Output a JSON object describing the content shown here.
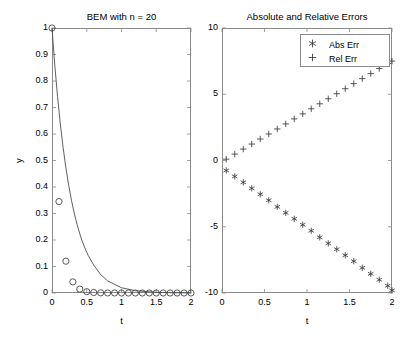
{
  "figure": {
    "width": 402,
    "height": 338,
    "background": "#ffffff",
    "axis_color": "#8a8a8a",
    "data_color": "#4d4d4d",
    "marker_color": "#3c3c3c"
  },
  "chart_data": [
    {
      "id": "left",
      "type": "line",
      "title": "BEM with n = 20",
      "xlabel": "t",
      "ylabel": "y",
      "xlim": [
        0,
        2
      ],
      "ylim": [
        0,
        1
      ],
      "grid": false,
      "legend": null,
      "xticks": [
        0,
        0.5,
        1,
        1.5,
        2
      ],
      "xtick_labels": [
        "0",
        "0.5",
        "1",
        "1.5",
        "2"
      ],
      "yticks": [
        0,
        0.1,
        0.2,
        0.3,
        0.4,
        0.5,
        0.6,
        0.7,
        0.8,
        0.9,
        1
      ],
      "ytick_labels": [
        "0",
        "0.1",
        "0.2",
        "0.3",
        "0.4",
        "0.5",
        "0.6",
        "0.7",
        "0.8",
        "0.9",
        "1"
      ],
      "series": [
        {
          "name": "exact",
          "style": "solid-line",
          "x": [
            0,
            0.04,
            0.08,
            0.12,
            0.16,
            0.2,
            0.24,
            0.28,
            0.32,
            0.36,
            0.4,
            0.44,
            0.48,
            0.52,
            0.6,
            0.7,
            0.8,
            1.0,
            1.2,
            1.5,
            1.8,
            2.0
          ],
          "y": [
            1.0,
            0.8607,
            0.7408,
            0.6376,
            0.5488,
            0.4724,
            0.4066,
            0.35,
            0.3012,
            0.2592,
            0.2231,
            0.192,
            0.1653,
            0.1423,
            0.1054,
            0.0695,
            0.0458,
            0.0198,
            0.0086,
            0.0025,
            0.0007,
            0.0003
          ]
        },
        {
          "name": "BEM numerical",
          "style": "open-circle-markers",
          "x": [
            0,
            0.1,
            0.2,
            0.3,
            0.4,
            0.5,
            0.6,
            0.7,
            0.8,
            0.9,
            1.0,
            1.1,
            1.2,
            1.3,
            1.4,
            1.5,
            1.6,
            1.7,
            1.8,
            1.9,
            2.0
          ],
          "y": [
            1.0,
            0.345,
            0.12,
            0.042,
            0.0148,
            0.0051,
            0.0018,
            0.0006,
            0.0002,
            0.0001,
            0.0,
            0.0,
            0.0,
            0.0,
            0.0,
            0.0,
            0.0,
            0.0,
            0.0,
            0.0,
            0.0
          ]
        }
      ]
    },
    {
      "id": "right",
      "type": "scatter",
      "title": "Absolute and Relative Errors",
      "xlabel": "t",
      "ylabel": "",
      "xlim": [
        0,
        2
      ],
      "ylim": [
        -10,
        10
      ],
      "grid": false,
      "legend_position": "top-right",
      "xticks": [
        0,
        0.5,
        1,
        1.5,
        2
      ],
      "xtick_labels": [
        "0",
        "0.5",
        "1",
        "1.5",
        "2"
      ],
      "yticks": [
        -10,
        -5,
        0,
        5,
        10
      ],
      "ytick_labels": [
        "-10",
        "-5",
        "0",
        "5",
        "10"
      ],
      "series": [
        {
          "name": "Abs Err",
          "marker": "asterisk",
          "legend_symbol": "✳",
          "x": [
            0.05,
            0.15,
            0.25,
            0.35,
            0.45,
            0.55,
            0.65,
            0.75,
            0.85,
            0.95,
            1.05,
            1.15,
            1.25,
            1.35,
            1.45,
            1.55,
            1.65,
            1.75,
            1.85,
            1.95,
            2.0
          ],
          "y": [
            -0.75,
            -1.2,
            -1.65,
            -2.1,
            -2.55,
            -3.0,
            -3.5,
            -3.95,
            -4.4,
            -4.85,
            -5.3,
            -5.8,
            -6.25,
            -6.7,
            -7.15,
            -7.6,
            -8.1,
            -8.55,
            -9.0,
            -9.45,
            -9.8
          ]
        },
        {
          "name": "Rel Err",
          "marker": "plus",
          "legend_symbol": "+",
          "x": [
            0.05,
            0.15,
            0.25,
            0.35,
            0.45,
            0.55,
            0.65,
            0.75,
            0.85,
            0.95,
            1.05,
            1.15,
            1.25,
            1.35,
            1.45,
            1.55,
            1.65,
            1.75,
            1.85,
            1.95,
            2.0
          ],
          "y": [
            0.1,
            0.48,
            0.86,
            1.24,
            1.62,
            2.0,
            2.38,
            2.76,
            3.14,
            3.52,
            3.9,
            4.28,
            4.66,
            5.04,
            5.42,
            5.8,
            6.18,
            6.56,
            6.94,
            7.32,
            7.5
          ]
        }
      ]
    }
  ]
}
